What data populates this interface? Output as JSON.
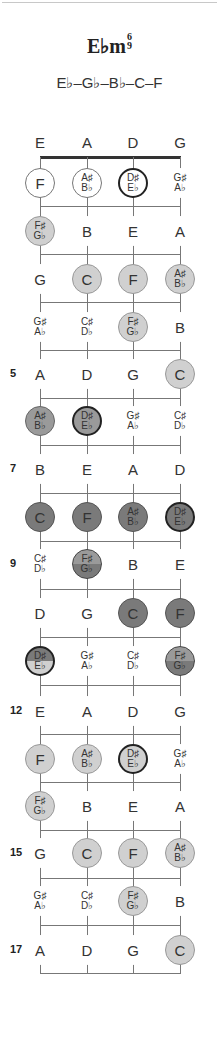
{
  "chord": {
    "name": "E♭m",
    "ext_top": "6",
    "ext_bottom": "9",
    "spelling": "E♭–G♭–B♭–C–F"
  },
  "strings": [
    "E",
    "A",
    "D",
    "G"
  ],
  "string_x": [
    40,
    87,
    133,
    180
  ],
  "colors": {
    "white": "#ffffff",
    "light": "#d0d0d0",
    "mid": "#9a9a9a",
    "dark": "#7a7a7a",
    "line": "#777777",
    "nut": "#333333"
  },
  "rows": [
    {
      "fret": 1,
      "label": "",
      "y": 183,
      "cells": [
        {
          "a": "F",
          "style": "white"
        },
        {
          "a": "A♯",
          "b": "B♭",
          "style": "white"
        },
        {
          "a": "D♯",
          "b": "E♭",
          "style": "white",
          "root": true
        },
        {
          "a": "G♯",
          "b": "A♭"
        }
      ]
    },
    {
      "fret": 2,
      "label": "",
      "y": 231,
      "cells": [
        {
          "a": "F♯",
          "b": "G♭",
          "style": "light"
        },
        {
          "a": "B"
        },
        {
          "a": "E"
        },
        {
          "a": "A"
        }
      ]
    },
    {
      "fret": 3,
      "label": "",
      "y": 279,
      "cells": [
        {
          "a": "G"
        },
        {
          "a": "C",
          "style": "light"
        },
        {
          "a": "F",
          "style": "light"
        },
        {
          "a": "A♯",
          "b": "B♭",
          "style": "light"
        }
      ]
    },
    {
      "fret": 4,
      "label": "",
      "y": 327,
      "cells": [
        {
          "a": "G♯",
          "b": "A♭"
        },
        {
          "a": "C♯",
          "b": "D♭"
        },
        {
          "a": "F♯",
          "b": "G♭",
          "style": "light"
        },
        {
          "a": "B"
        }
      ]
    },
    {
      "fret": 5,
      "label": "5",
      "y": 374,
      "cells": [
        {
          "a": "A"
        },
        {
          "a": "D"
        },
        {
          "a": "G"
        },
        {
          "a": "C",
          "style": "light"
        }
      ]
    },
    {
      "fret": 6,
      "label": "",
      "y": 421,
      "cells": [
        {
          "a": "A♯",
          "b": "B♭",
          "style": "mid"
        },
        {
          "a": "D♯",
          "b": "E♭",
          "style": "mid",
          "root": true
        },
        {
          "a": "G♯",
          "b": "A♭"
        },
        {
          "a": "C♯",
          "b": "D♭"
        }
      ]
    },
    {
      "fret": 7,
      "label": "7",
      "y": 469,
      "cells": [
        {
          "a": "B"
        },
        {
          "a": "E"
        },
        {
          "a": "A"
        },
        {
          "a": "D"
        }
      ]
    },
    {
      "fret": 8,
      "label": "",
      "y": 517,
      "cells": [
        {
          "a": "C",
          "style": "dark"
        },
        {
          "a": "F",
          "style": "dark"
        },
        {
          "a": "A♯",
          "b": "B♭",
          "style": "dark"
        },
        {
          "a": "D♯",
          "b": "E♭",
          "style": "dark",
          "root": true
        }
      ]
    },
    {
      "fret": 9,
      "label": "9",
      "y": 564,
      "cells": [
        {
          "a": "C♯",
          "b": "D♭"
        },
        {
          "a": "F♯",
          "b": "G♭",
          "style": "splitdark"
        },
        {
          "a": "B"
        },
        {
          "a": "E"
        }
      ]
    },
    {
      "fret": 10,
      "label": "",
      "y": 613,
      "cells": [
        {
          "a": "D"
        },
        {
          "a": "G"
        },
        {
          "a": "C",
          "style": "dark"
        },
        {
          "a": "F",
          "style": "dark"
        }
      ]
    },
    {
      "fret": 11,
      "label": "",
      "y": 661,
      "cells": [
        {
          "a": "D♯",
          "b": "E♭",
          "style": "split",
          "root": true
        },
        {
          "a": "G♯",
          "b": "A♭"
        },
        {
          "a": "C♯",
          "b": "D♭"
        },
        {
          "a": "F♯",
          "b": "G♭",
          "style": "splitdark"
        }
      ]
    },
    {
      "fret": 12,
      "label": "12",
      "y": 711,
      "cells": [
        {
          "a": "E"
        },
        {
          "a": "A"
        },
        {
          "a": "D"
        },
        {
          "a": "G"
        }
      ]
    },
    {
      "fret": 13,
      "label": "",
      "y": 759,
      "cells": [
        {
          "a": "F",
          "style": "light"
        },
        {
          "a": "A♯",
          "b": "B♭",
          "style": "light"
        },
        {
          "a": "D♯",
          "b": "E♭",
          "style": "light",
          "root": true
        },
        {
          "a": "G♯",
          "b": "A♭"
        }
      ]
    },
    {
      "fret": 14,
      "label": "",
      "y": 806,
      "cells": [
        {
          "a": "F♯",
          "b": "G♭",
          "style": "light"
        },
        {
          "a": "B"
        },
        {
          "a": "E"
        },
        {
          "a": "A"
        }
      ]
    },
    {
      "fret": 15,
      "label": "15",
      "y": 853,
      "cells": [
        {
          "a": "G"
        },
        {
          "a": "C",
          "style": "light"
        },
        {
          "a": "F",
          "style": "light"
        },
        {
          "a": "A♯",
          "b": "B♭",
          "style": "light"
        }
      ]
    },
    {
      "fret": 16,
      "label": "",
      "y": 901,
      "cells": [
        {
          "a": "G♯",
          "b": "A♭"
        },
        {
          "a": "C♯",
          "b": "D♭"
        },
        {
          "a": "F♯",
          "b": "G♭",
          "style": "light"
        },
        {
          "a": "B"
        }
      ]
    },
    {
      "fret": 17,
      "label": "17",
      "y": 950,
      "cells": [
        {
          "a": "A"
        },
        {
          "a": "D"
        },
        {
          "a": "G"
        },
        {
          "a": "C",
          "style": "light"
        }
      ]
    }
  ],
  "fret_lines_y": [
    206,
    254,
    302,
    350,
    398,
    445,
    493,
    541,
    589,
    637,
    685,
    734,
    782,
    830,
    878,
    925,
    973
  ]
}
